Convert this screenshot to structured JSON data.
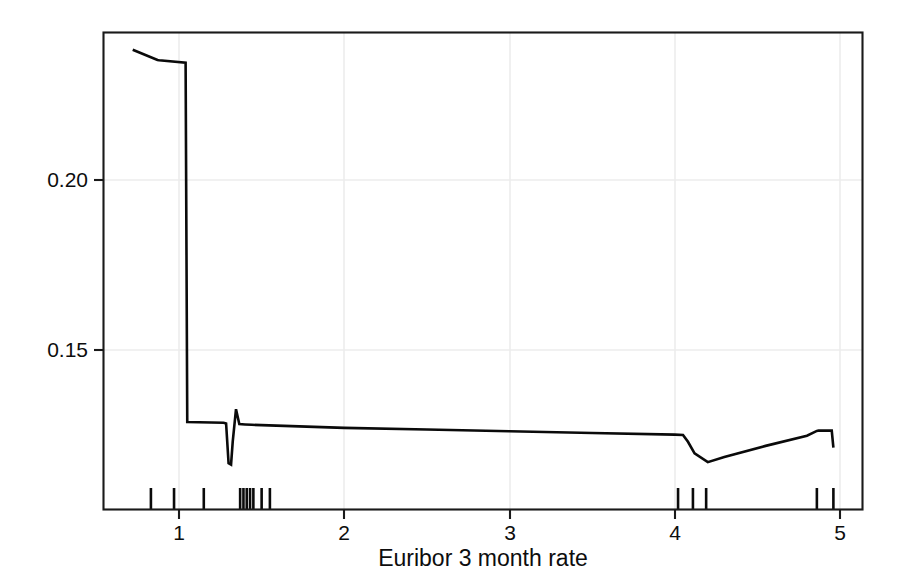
{
  "chart_data": {
    "type": "line",
    "title": "",
    "subtitle": "",
    "xlabel": "Euribor 3 month rate",
    "ylabel": "Partial dependence",
    "xlim": [
      0.64,
      5.13
    ],
    "ylim": [
      0.1145,
      0.2395
    ],
    "xticks": [
      1,
      2,
      3,
      4,
      5
    ],
    "xtick_labels": [
      "1",
      "2",
      "3",
      "4",
      "5"
    ],
    "yticks": [
      0.15,
      0.2
    ],
    "ytick_labels": [
      "0.15",
      "0.20"
    ],
    "grid": true,
    "grid_color": "#e8e8e8",
    "legend": "none",
    "line_color": "#0a0a0a",
    "line_width": 2.6,
    "series": [
      {
        "name": "Partial dependence",
        "x": [
          0.72,
          0.87,
          0.88,
          1.04,
          1.05,
          1.27,
          1.285,
          1.3,
          1.315,
          1.325,
          1.345,
          1.365,
          1.4,
          1.44,
          2.0,
          2.5,
          3.0,
          3.5,
          4.0,
          4.05,
          4.08,
          4.12,
          4.2,
          4.3,
          4.55,
          4.8,
          4.86,
          4.87,
          4.95,
          4.96
        ],
        "y": [
          0.2383,
          0.2353,
          0.2352,
          0.2345,
          0.1288,
          0.1286,
          0.1284,
          0.1167,
          0.1163,
          0.123,
          0.1326,
          0.1282,
          0.1281,
          0.128,
          0.1271,
          0.1266,
          0.1261,
          0.1256,
          0.1251,
          0.125,
          0.123,
          0.1196,
          0.117,
          0.1185,
          0.1218,
          0.1248,
          0.1262,
          0.1263,
          0.1263,
          0.1213
        ]
      }
    ],
    "rug": {
      "label": "rug-marks",
      "values": [
        0.83,
        0.97,
        1.15,
        1.37,
        1.39,
        1.41,
        1.43,
        1.45,
        1.5,
        1.55,
        4.02,
        4.11,
        4.19,
        4.86,
        4.96
      ]
    }
  },
  "axis": {
    "y_label_text": "Partial dependence",
    "x_label_text": "Euribor 3 month rate",
    "y_tick_0": "0.20",
    "y_tick_1": "0.15",
    "x_tick_0": "1",
    "x_tick_1": "2",
    "x_tick_2": "3",
    "x_tick_3": "4",
    "x_tick_4": "5"
  },
  "style": {
    "frame_color": "#1a1a1a",
    "background": "#ffffff",
    "line_color": "#0a0a0a",
    "grid_color": "#ededed"
  }
}
